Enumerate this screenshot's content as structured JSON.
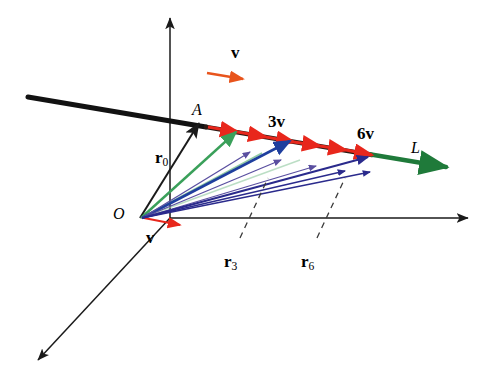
{
  "figure": {
    "background": "#ffffff",
    "colors": {
      "axis": "#1a1a1a",
      "line_black": "#121212",
      "line_green": "#1f7a3a",
      "arrow_red": "#e8271c",
      "arrow_orange": "#e8541c",
      "vector_green": "#3aa05a",
      "vector_blue": "#1f3f9e",
      "vector_purple": "#5a4fa0",
      "vector_navy": "#2a2a8c",
      "dash_gray": "#555555",
      "label_black": "#000000"
    },
    "labels": [
      {
        "id": "v-top",
        "text": "v",
        "x": 231,
        "y": 44,
        "size": 17,
        "bold": true,
        "italic": false
      },
      {
        "id": "point-A",
        "text": "A",
        "x": 192,
        "y": 102,
        "size": 16,
        "bold": false,
        "italic": true
      },
      {
        "id": "three-v",
        "text": "3v",
        "x": 268,
        "y": 113,
        "size": 17,
        "bold": true,
        "italic": false
      },
      {
        "id": "six-v",
        "text": "6v",
        "x": 357,
        "y": 125,
        "size": 17,
        "bold": true,
        "italic": false
      },
      {
        "id": "line-L",
        "text": "L",
        "x": 411,
        "y": 140,
        "size": 16,
        "bold": false,
        "italic": true
      },
      {
        "id": "origin-O",
        "text": "O",
        "x": 113,
        "y": 206,
        "size": 16,
        "bold": false,
        "italic": true
      },
      {
        "id": "v-bottom",
        "text": "v",
        "x": 146,
        "y": 229,
        "size": 17,
        "bold": true,
        "italic": false
      }
    ],
    "subscript_labels": [
      {
        "id": "r0",
        "base": "r",
        "sub": "0",
        "x": 155,
        "y": 149,
        "size": 17
      },
      {
        "id": "r3",
        "base": "r",
        "sub": "3",
        "x": 224,
        "y": 253,
        "size": 17
      },
      {
        "id": "r6",
        "base": "r",
        "sub": "6",
        "x": 301,
        "y": 253,
        "size": 17
      }
    ]
  }
}
